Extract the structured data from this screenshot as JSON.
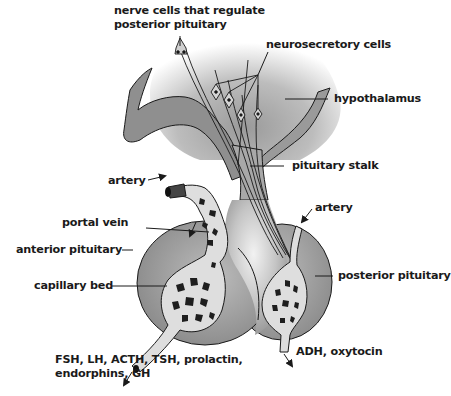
{
  "diagram": {
    "labels": {
      "nerve_cells_line1": "nerve cells that regulate",
      "nerve_cells_line2": "posterior pituitary",
      "neurosecretory_cells": "neurosecretory cells",
      "hypothalamus": "hypothalamus",
      "artery_left": "artery",
      "pituitary_stalk": "pituitary stalk",
      "artery_right": "artery",
      "portal_vein": "portal vein",
      "anterior_pituitary": "anterior pituitary",
      "capillary_bed": "capillary bed",
      "posterior_pituitary": "posterior pituitary",
      "anterior_hormones_line1": "FSH, LH, ACTH, TSH, prolactin,",
      "anterior_hormones_line2": "endorphins, GH",
      "posterior_hormones": "ADH, oxytocin"
    },
    "colors": {
      "tissue_gray": "#8c8c8c",
      "tissue_light": "#d9d9d9",
      "vessel_fill": "#dedede",
      "vessel_hole": "#1e1e1e",
      "line": "#1a1a1a",
      "text": "#1a1a1a"
    }
  }
}
